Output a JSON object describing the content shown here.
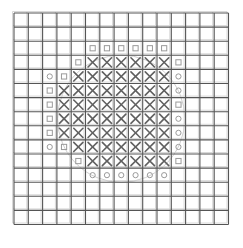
{
  "figure": {
    "title": "",
    "canvas": {
      "width": 243,
      "height": 248
    },
    "background_color": "#ffffff"
  },
  "grid": {
    "columns": 15,
    "rows": 15,
    "origin_x": 14,
    "origin_y": 13,
    "cell_width": 14.3,
    "cell_height": 14.1,
    "line_color": "#555555",
    "line_width": 1.1,
    "faint_line_color": "#d8d8d8"
  },
  "circle_outline": {
    "visible": true,
    "center_col": 8.0,
    "center_row": 8.0,
    "radius_cells": 4.45,
    "stroke_color": "#cfcfcf",
    "stroke_width": 1.0
  },
  "marks": {
    "x_glyph": "×",
    "x_color": "#606060",
    "x_stroke_width": 1.6,
    "marker_color": "#9a9a9a",
    "marker_size": 5.2,
    "square_marker": "square",
    "circle_marker": "circle"
  },
  "chart_data": {
    "type": "heatmap",
    "title": "",
    "xlabel": "",
    "ylabel": "",
    "legend": [],
    "categories_x": [
      "1",
      "2",
      "3",
      "4",
      "5",
      "6",
      "7",
      "8",
      "9",
      "10",
      "11",
      "12",
      "13",
      "14",
      "15"
    ],
    "categories_y": [
      "1",
      "2",
      "3",
      "4",
      "5",
      "6",
      "7",
      "8",
      "9",
      "10",
      "11",
      "12",
      "13",
      "14",
      "15"
    ],
    "x_cells": [
      {
        "row": 4,
        "cols": [
          6,
          7,
          8,
          9,
          10,
          11
        ]
      },
      {
        "row": 5,
        "cols": [
          5,
          6,
          7,
          8,
          9,
          10,
          11
        ]
      },
      {
        "row": 6,
        "cols": [
          4,
          5,
          6,
          7,
          8,
          9,
          10,
          11
        ]
      },
      {
        "row": 7,
        "cols": [
          4,
          5,
          6,
          7,
          8,
          9,
          10,
          11
        ]
      },
      {
        "row": 8,
        "cols": [
          4,
          5,
          6,
          7,
          8,
          9,
          10,
          11
        ]
      },
      {
        "row": 9,
        "cols": [
          4,
          5,
          6,
          7,
          8,
          9,
          10,
          11
        ]
      },
      {
        "row": 10,
        "cols": [
          5,
          6,
          7,
          8,
          9,
          10,
          11
        ]
      },
      {
        "row": 11,
        "cols": [
          6,
          7,
          8,
          9,
          10,
          11
        ]
      }
    ],
    "square_markers": [
      {
        "row": 3,
        "col": 6
      },
      {
        "row": 3,
        "col": 7
      },
      {
        "row": 3,
        "col": 8
      },
      {
        "row": 3,
        "col": 9
      },
      {
        "row": 3,
        "col": 10
      },
      {
        "row": 3,
        "col": 11
      },
      {
        "row": 4,
        "col": 5
      },
      {
        "row": 4,
        "col": 12
      },
      {
        "row": 5,
        "col": 4
      },
      {
        "row": 6,
        "col": 3
      },
      {
        "row": 7,
        "col": 3
      },
      {
        "row": 7,
        "col": 12
      },
      {
        "row": 8,
        "col": 3
      },
      {
        "row": 9,
        "col": 3
      },
      {
        "row": 10,
        "col": 4
      },
      {
        "row": 11,
        "col": 5
      },
      {
        "row": 11,
        "col": 12
      }
    ],
    "circle_markers": [
      {
        "row": 5,
        "col": 3
      },
      {
        "row": 5,
        "col": 12
      },
      {
        "row": 6,
        "col": 12
      },
      {
        "row": 8,
        "col": 12
      },
      {
        "row": 9,
        "col": 12
      },
      {
        "row": 10,
        "col": 3
      },
      {
        "row": 10,
        "col": 12
      },
      {
        "row": 12,
        "col": 6
      },
      {
        "row": 12,
        "col": 7
      },
      {
        "row": 12,
        "col": 8
      },
      {
        "row": 12,
        "col": 9
      },
      {
        "row": 12,
        "col": 10
      },
      {
        "row": 12,
        "col": 11
      }
    ],
    "counts": {
      "total_cells": 225,
      "x_cells": 60,
      "square_markers": 17,
      "circle_markers": 13
    }
  }
}
